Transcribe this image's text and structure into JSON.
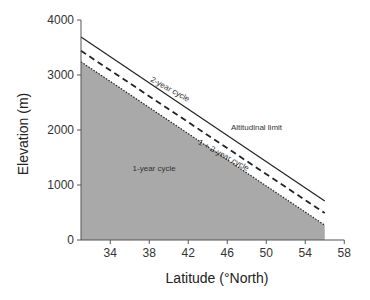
{
  "chart_data": {
    "type": "area",
    "title": "",
    "xlabel": "Latitude (°North)",
    "ylabel": "Elevation (m)",
    "xlim": [
      31,
      58
    ],
    "ylim": [
      0,
      4000
    ],
    "xticks": [
      34,
      38,
      42,
      46,
      50,
      54,
      58
    ],
    "yticks": [
      0,
      1000,
      2000,
      3000,
      4000
    ],
    "grid": false,
    "legend": "none",
    "series": [
      {
        "name": "Altitudinal limit",
        "style": "solid",
        "x": [
          31,
          56
        ],
        "y": [
          3690,
          710
        ]
      },
      {
        "name": "2-year cycle boundary",
        "style": "dashed",
        "x": [
          31,
          56
        ],
        "y": [
          3440,
          490
        ]
      },
      {
        "name": "1-year cycle boundary",
        "style": "dotted",
        "fill": "#a9a9a9",
        "x": [
          31,
          56
        ],
        "y": [
          3240,
          270
        ]
      }
    ],
    "annotations": [
      {
        "text": "Altitudinal limit",
        "lat": 49,
        "elev": 2000
      },
      {
        "text": "2-year cycle",
        "lat": 40,
        "elev": 2700,
        "rotated": true
      },
      {
        "text": "1 + 2-year cycle",
        "lat": 45.5,
        "elev": 1500,
        "rotated": true
      },
      {
        "text": "1-year cycle",
        "lat": 38.5,
        "elev": 1250
      }
    ]
  },
  "colors": {
    "fill": "#a9a9a9",
    "line": "#222222",
    "axis": "#555555"
  }
}
